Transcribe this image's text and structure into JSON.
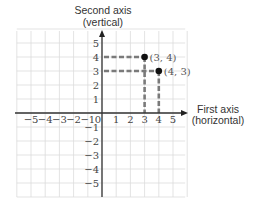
{
  "diagram": {
    "type": "coordinate-plane",
    "vertical_axis": {
      "title_line1": "Second axis",
      "title_line2": "(vertical)"
    },
    "horizontal_axis": {
      "title_line1": "First axis",
      "title_line2": "(horizontal)"
    },
    "origin_label": "0",
    "x_tick_labels": [
      "−5",
      "−4",
      "−3",
      "−2",
      "−1",
      "1",
      "2",
      "3",
      "4",
      "5"
    ],
    "x_tick_values": [
      -5,
      -4,
      -3,
      -2,
      -1,
      1,
      2,
      3,
      4,
      5
    ],
    "y_tick_labels": [
      "5",
      "4",
      "3",
      "2",
      "1",
      "−1",
      "−2",
      "−3",
      "−4",
      "−5"
    ],
    "y_tick_values": [
      5,
      4,
      3,
      2,
      1,
      -1,
      -2,
      -3,
      -4,
      -5
    ],
    "grid_range": {
      "x": [
        -6,
        6
      ],
      "y": [
        -6,
        6
      ]
    },
    "points": [
      {
        "x": 3,
        "y": 4,
        "label": "(3, 4)"
      },
      {
        "x": 4,
        "y": 3,
        "label": "(4, 3)"
      }
    ],
    "colors": {
      "grid": "#dcdcdc",
      "axis": "#333333",
      "dashed_guides": "#7a7a7a",
      "point": "#111111"
    }
  }
}
